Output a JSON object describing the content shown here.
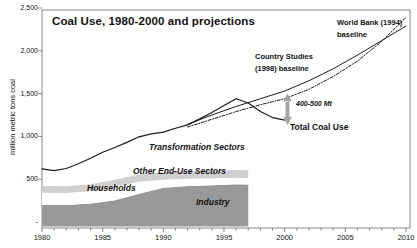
{
  "chart": {
    "title": "Coal Use, 1980-2000 and projections",
    "y_axis_title": "million metric tons coal",
    "annotations": {
      "world_bank_line1": "World Bank (1994)",
      "world_bank_line2": "baseline",
      "country_studies_line1": "Country Studies",
      "country_studies_line2": "(1998) baseline",
      "gap": "400-500 Mt",
      "total": "Total Coal Use",
      "transformation": "Transformation Sectors",
      "other_end_use": "Other End-Use Sectors",
      "households": "Households",
      "industry": "Industry"
    }
  },
  "chart_data": {
    "type": "area",
    "subtype": "stacked area (historical 1980-1997) + projection lines to 2010",
    "title": "Coal Use, 1980-2000 and projections",
    "xlabel": "",
    "ylabel": "million metric tons coal",
    "x_axis": {
      "min": 1980,
      "max": 2010,
      "minor_tick_interval": 1,
      "ticks": [
        {
          "label": "1980",
          "year": 1980
        },
        {
          "label": "1985",
          "year": 1985
        },
        {
          "label": "1990",
          "year": 1990
        },
        {
          "label": "1995",
          "year": 1995
        },
        {
          "label": "2000",
          "year": 2000
        },
        {
          "label": "2005",
          "year": 2005
        },
        {
          "label": "2010",
          "year": 2010
        }
      ]
    },
    "y_axis": {
      "min": 0,
      "max": 2500,
      "ticks": [
        {
          "label": "2,500",
          "value": 2500
        },
        {
          "label": "2,000",
          "value": 2000
        },
        {
          "label": "1,500",
          "value": 1500
        },
        {
          "label": "1,000",
          "value": 1000
        },
        {
          "label": "500",
          "value": 500
        },
        {
          "label": "-",
          "value": 0
        }
      ]
    },
    "stacked_areas": {
      "note": "cumulative upper boundaries in million metric tons, historical data ends 1997",
      "years": [
        1980,
        1982,
        1984,
        1986,
        1988,
        1990,
        1992,
        1994,
        1996,
        1997
      ],
      "industry_top": [
        200,
        198,
        215,
        255,
        330,
        400,
        420,
        430,
        440,
        438
      ],
      "households_top": [
        340,
        338,
        360,
        410,
        470,
        495,
        505,
        512,
        518,
        515
      ],
      "other_end_use_top": [
        420,
        418,
        442,
        495,
        555,
        580,
        592,
        600,
        607,
        604
      ]
    },
    "series": [
      {
        "name": "Total Coal Use",
        "style": "solid",
        "years": [
          1980,
          1981,
          1982,
          1983,
          1984,
          1985,
          1986,
          1987,
          1988,
          1989,
          1990,
          1991,
          1992,
          1993,
          1994,
          1995,
          1996,
          1997,
          1998,
          1999,
          2000
        ],
        "values": [
          620,
          600,
          625,
          680,
          745,
          815,
          870,
          930,
          995,
          1030,
          1050,
          1095,
          1135,
          1205,
          1280,
          1360,
          1440,
          1390,
          1290,
          1220,
          1190
        ]
      },
      {
        "name": "Country Studies (1998) baseline",
        "style": "solid",
        "years": [
          1992,
          1994,
          1996,
          1998,
          2000,
          2002,
          2004,
          2006,
          2008,
          2010
        ],
        "values": [
          1140,
          1250,
          1350,
          1440,
          1530,
          1650,
          1790,
          1950,
          2120,
          2290
        ]
      },
      {
        "name": "World Bank (1994) baseline",
        "style": "dotted",
        "years": [
          1992,
          1994,
          1996,
          1998,
          2000,
          2002,
          2004,
          2006,
          2008,
          2010
        ],
        "values": [
          1110,
          1200,
          1290,
          1370,
          1440,
          1550,
          1700,
          1880,
          2110,
          2390
        ]
      }
    ],
    "gap_annotation": {
      "text": "400-500 Mt",
      "at_year": 2000,
      "between": [
        "projection baselines",
        "Total Coal Use"
      ]
    },
    "legend_position": "inline annotations",
    "grid": false,
    "colors": {
      "industry_fill": "#999999",
      "households_fill": "#ffffff",
      "other_end_use_fill": "#d0d0d0",
      "transformation_fill": "#ffffff",
      "line": "#1a1a1a",
      "arrow": "#a3a3a3",
      "frame": "#888888",
      "tick": "#666666"
    }
  }
}
